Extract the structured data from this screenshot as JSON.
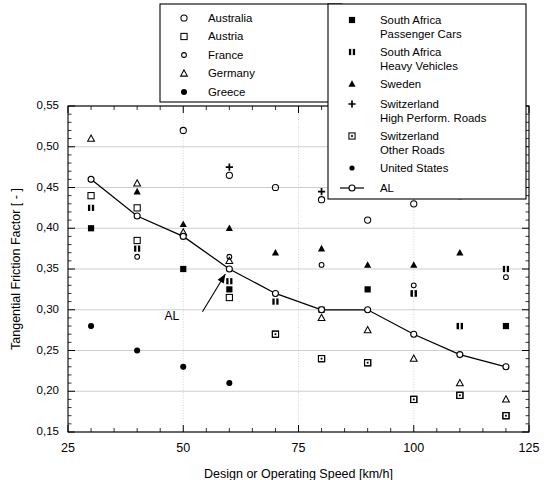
{
  "chart_data": {
    "type": "scatter",
    "title": "",
    "xlabel": "Design or Operating Speed [km/h]",
    "ylabel": "Tangential Friction Factor [ - ]",
    "xlim": [
      25,
      125
    ],
    "ylim": [
      0.15,
      0.55
    ],
    "xticks": [
      25,
      50,
      75,
      100,
      125
    ],
    "xticklabels": [
      "25",
      "50",
      "75",
      "100",
      "125"
    ],
    "xminorticks": [
      30,
      35,
      40,
      45,
      55,
      60,
      65,
      70,
      80,
      85,
      90,
      95,
      105,
      110,
      115,
      120
    ],
    "yticks": [
      0.15,
      0.2,
      0.25,
      0.3,
      0.35,
      0.4,
      0.45,
      0.5,
      0.55
    ],
    "yticklabels": [
      "0,15",
      "0,20",
      "0,25",
      "0,30",
      "0,35",
      "0,40",
      "0,45",
      "0,50",
      "0,55"
    ],
    "grid": "both",
    "legend_position": "top",
    "annotations": [
      {
        "text": "AL",
        "x": 52,
        "y": 0.295,
        "arrow_to_x": 60,
        "arrow_to_y": 0.35
      }
    ],
    "series": [
      {
        "name": "Australia",
        "marker": "open-circle-small",
        "points": [
          [
            50,
            0.52
          ],
          [
            60,
            0.465
          ],
          [
            70,
            0.45
          ],
          [
            80,
            0.435
          ],
          [
            90,
            0.41
          ],
          [
            100,
            0.43
          ],
          [
            110,
            0.44
          ],
          [
            120,
            0.45
          ]
        ]
      },
      {
        "name": "Austria",
        "marker": "open-square",
        "points": [
          [
            30,
            0.44
          ],
          [
            40,
            0.425
          ],
          [
            40,
            0.385
          ],
          [
            60,
            0.315
          ],
          [
            70,
            0.27
          ],
          [
            80,
            0.24
          ],
          [
            90,
            0.235
          ],
          [
            100,
            0.19
          ],
          [
            110,
            0.195
          ],
          [
            120,
            0.17
          ]
        ]
      },
      {
        "name": "France",
        "marker": "open-circle-tiny",
        "points": [
          [
            40,
            0.365
          ],
          [
            60,
            0.365
          ],
          [
            80,
            0.355
          ],
          [
            100,
            0.33
          ],
          [
            120,
            0.34
          ]
        ]
      },
      {
        "name": "Germany",
        "marker": "open-triangle",
        "points": [
          [
            30,
            0.51
          ],
          [
            40,
            0.455
          ],
          [
            50,
            0.395
          ],
          [
            60,
            0.36
          ],
          [
            80,
            0.29
          ],
          [
            90,
            0.275
          ],
          [
            100,
            0.24
          ],
          [
            110,
            0.21
          ],
          [
            120,
            0.19
          ]
        ]
      },
      {
        "name": "Greece",
        "marker": "filled-circle",
        "points": [
          [
            30,
            0.28
          ],
          [
            40,
            0.25
          ],
          [
            50,
            0.23
          ],
          [
            60,
            0.21
          ]
        ]
      },
      {
        "name": "South Africa Passenger Cars",
        "marker": "filled-square",
        "points": [
          [
            30,
            0.4
          ],
          [
            50,
            0.35
          ],
          [
            60,
            0.325
          ],
          [
            80,
            0.3
          ],
          [
            90,
            0.325
          ],
          [
            100,
            0.32
          ],
          [
            110,
            0.28
          ],
          [
            120,
            0.28
          ]
        ]
      },
      {
        "name": "South Africa Heavy Vehicles",
        "marker": "filled-dot-square",
        "points": [
          [
            30,
            0.425
          ],
          [
            40,
            0.375
          ],
          [
            60,
            0.335
          ],
          [
            70,
            0.31
          ],
          [
            100,
            0.32
          ],
          [
            110,
            0.28
          ],
          [
            120,
            0.35
          ]
        ]
      },
      {
        "name": "Sweden",
        "marker": "filled-triangle",
        "points": [
          [
            40,
            0.445
          ],
          [
            50,
            0.405
          ],
          [
            60,
            0.4
          ],
          [
            70,
            0.37
          ],
          [
            80,
            0.375
          ],
          [
            90,
            0.355
          ],
          [
            100,
            0.355
          ],
          [
            110,
            0.37
          ]
        ]
      },
      {
        "name": "Switzerland High Perform. Roads",
        "marker": "plus",
        "points": [
          [
            60,
            0.475
          ],
          [
            80,
            0.445
          ],
          [
            100,
            0.44
          ],
          [
            120,
            0.455
          ]
        ]
      },
      {
        "name": "Switzerland Other Roads",
        "marker": "open-square-dot",
        "points": [
          [
            70,
            0.27
          ],
          [
            80,
            0.24
          ],
          [
            90,
            0.235
          ],
          [
            100,
            0.19
          ],
          [
            110,
            0.195
          ],
          [
            120,
            0.17
          ]
        ]
      },
      {
        "name": "United States",
        "marker": "filled-circle-small",
        "points": [
          [
            30,
            0.28
          ],
          [
            40,
            0.25
          ],
          [
            50,
            0.23
          ],
          [
            60,
            0.21
          ]
        ]
      },
      {
        "name": "AL",
        "marker": "line-open-circle",
        "line": true,
        "points": [
          [
            30,
            0.46
          ],
          [
            40,
            0.415
          ],
          [
            50,
            0.39
          ],
          [
            60,
            0.35
          ],
          [
            70,
            0.32
          ],
          [
            80,
            0.3
          ],
          [
            90,
            0.3
          ],
          [
            100,
            0.27
          ],
          [
            110,
            0.245
          ],
          [
            120,
            0.23
          ]
        ]
      }
    ]
  },
  "legend": {
    "left_column": [
      {
        "label": "Australia",
        "marker": "open-circle-small"
      },
      {
        "label": "Austria",
        "marker": "open-square"
      },
      {
        "label": "France",
        "marker": "open-circle-tiny"
      },
      {
        "label": "Germany",
        "marker": "open-triangle"
      },
      {
        "label": "Greece",
        "marker": "filled-circle"
      }
    ],
    "right_column": [
      {
        "label_line1": "South Africa",
        "label_line2": "Passenger Cars",
        "marker": "filled-square"
      },
      {
        "label_line1": "South Africa",
        "label_line2": "Heavy Vehicles",
        "marker": "filled-dot-square"
      },
      {
        "label_line1": "Sweden",
        "label_line2": "",
        "marker": "filled-triangle"
      },
      {
        "label_line1": "Switzerland",
        "label_line2": "High Perform. Roads",
        "marker": "plus"
      },
      {
        "label_line1": "Switzerland",
        "label_line2": "Other Roads",
        "marker": "open-square-dot"
      },
      {
        "label_line1": "United States",
        "label_line2": "",
        "marker": "filled-circle-small"
      },
      {
        "label_line1": "AL",
        "label_line2": "",
        "marker": "line-open-circle"
      }
    ]
  },
  "axes": {
    "x_title": "Design or Operating Speed [km/h]",
    "y_title": "Tangential Friction Factor [ - ]",
    "x_ticks": [
      "25",
      "50",
      "75",
      "100",
      "125"
    ],
    "y_ticks": [
      "0,55",
      "0,50",
      "0,45",
      "0,40",
      "0,35",
      "0,30",
      "0,25",
      "0,20",
      "0,15"
    ]
  },
  "annotation_label": "AL",
  "colors": {
    "ink": "#000000",
    "grid": "#b9b9b9",
    "background": "#ffffff"
  }
}
